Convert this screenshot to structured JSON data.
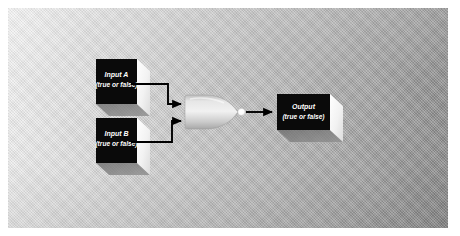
{
  "diagram": {
    "type": "logic-gate",
    "gate": {
      "name": "and-gate",
      "shape": "bullet",
      "output_dot": true
    },
    "background": {
      "panel_color_left": "#f2f2f2",
      "panel_color_right": "#858585",
      "page_color": "#ffffff"
    },
    "colors": {
      "box_face": "#0a0a0a",
      "box_side": "#f0f0f0",
      "box_shadow": "#6e6e6e",
      "wire": "#000000",
      "gate_fill": "#d6d6d6",
      "gate_highlight": "#efefef",
      "output_dot": "#ffffff"
    },
    "nodes": [
      {
        "id": "input-a",
        "name": "input-a-box",
        "line1": "Input A",
        "line2": "(true or false)"
      },
      {
        "id": "input-b",
        "name": "input-b-box",
        "line1": "Input B",
        "line2": "(true or false)"
      },
      {
        "id": "output",
        "name": "output-box",
        "line1": "Output",
        "line2": "(true or false)"
      }
    ],
    "connectors": [
      {
        "id": "wire-a",
        "from": "input-a",
        "to": "gate",
        "arrow": true
      },
      {
        "id": "wire-b",
        "from": "input-b",
        "to": "gate",
        "arrow": true
      },
      {
        "id": "wire-out",
        "from": "gate",
        "to": "output",
        "arrow": true
      }
    ]
  }
}
